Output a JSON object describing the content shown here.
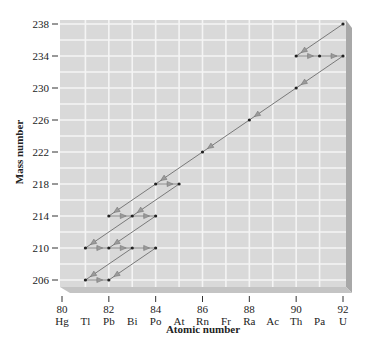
{
  "chart_data": {
    "type": "scatter",
    "title": "",
    "xlabel": "Atomic number",
    "ylabel": "Mass number",
    "xlim": [
      80,
      92
    ],
    "ylim": [
      206,
      238
    ],
    "grid": true,
    "x_ticks": [
      80,
      82,
      84,
      86,
      88,
      90,
      92
    ],
    "y_ticks": [
      206,
      210,
      214,
      218,
      222,
      226,
      230,
      234,
      238
    ],
    "element_labels": [
      {
        "z": 80,
        "symbol": "Hg"
      },
      {
        "z": 81,
        "symbol": "Tl"
      },
      {
        "z": 82,
        "symbol": "Pb"
      },
      {
        "z": 83,
        "symbol": "Bi"
      },
      {
        "z": 84,
        "symbol": "Po"
      },
      {
        "z": 85,
        "symbol": "At"
      },
      {
        "z": 86,
        "symbol": "Rn"
      },
      {
        "z": 87,
        "symbol": "Fr"
      },
      {
        "z": 88,
        "symbol": "Ra"
      },
      {
        "z": 89,
        "symbol": "Ac"
      },
      {
        "z": 90,
        "symbol": "Th"
      },
      {
        "z": 91,
        "symbol": "Pa"
      },
      {
        "z": 92,
        "symbol": "U"
      }
    ],
    "nuclides": [
      {
        "z": 92,
        "a": 238
      },
      {
        "z": 90,
        "a": 234
      },
      {
        "z": 91,
        "a": 234
      },
      {
        "z": 92,
        "a": 234
      },
      {
        "z": 90,
        "a": 230
      },
      {
        "z": 88,
        "a": 226
      },
      {
        "z": 86,
        "a": 222
      },
      {
        "z": 84,
        "a": 218
      },
      {
        "z": 85,
        "a": 218
      },
      {
        "z": 82,
        "a": 214
      },
      {
        "z": 83,
        "a": 214
      },
      {
        "z": 84,
        "a": 214
      },
      {
        "z": 81,
        "a": 210
      },
      {
        "z": 82,
        "a": 210
      },
      {
        "z": 83,
        "a": 210
      },
      {
        "z": 84,
        "a": 210
      },
      {
        "z": 81,
        "a": 206
      },
      {
        "z": 82,
        "a": 206
      }
    ],
    "decays": [
      {
        "from": [
          92,
          238
        ],
        "to": [
          90,
          234
        ],
        "mode": "alpha"
      },
      {
        "from": [
          90,
          234
        ],
        "to": [
          91,
          234
        ],
        "mode": "beta"
      },
      {
        "from": [
          91,
          234
        ],
        "to": [
          92,
          234
        ],
        "mode": "beta"
      },
      {
        "from": [
          92,
          234
        ],
        "to": [
          90,
          230
        ],
        "mode": "alpha"
      },
      {
        "from": [
          90,
          230
        ],
        "to": [
          88,
          226
        ],
        "mode": "alpha"
      },
      {
        "from": [
          88,
          226
        ],
        "to": [
          86,
          222
        ],
        "mode": "alpha"
      },
      {
        "from": [
          86,
          222
        ],
        "to": [
          84,
          218
        ],
        "mode": "alpha"
      },
      {
        "from": [
          84,
          218
        ],
        "to": [
          85,
          218
        ],
        "mode": "beta"
      },
      {
        "from": [
          84,
          218
        ],
        "to": [
          82,
          214
        ],
        "mode": "alpha"
      },
      {
        "from": [
          85,
          218
        ],
        "to": [
          83,
          214
        ],
        "mode": "alpha"
      },
      {
        "from": [
          82,
          214
        ],
        "to": [
          83,
          214
        ],
        "mode": "beta"
      },
      {
        "from": [
          83,
          214
        ],
        "to": [
          84,
          214
        ],
        "mode": "beta"
      },
      {
        "from": [
          83,
          214
        ],
        "to": [
          81,
          210
        ],
        "mode": "alpha"
      },
      {
        "from": [
          84,
          214
        ],
        "to": [
          82,
          210
        ],
        "mode": "alpha"
      },
      {
        "from": [
          81,
          210
        ],
        "to": [
          82,
          210
        ],
        "mode": "beta"
      },
      {
        "from": [
          82,
          210
        ],
        "to": [
          83,
          210
        ],
        "mode": "beta"
      },
      {
        "from": [
          83,
          210
        ],
        "to": [
          84,
          210
        ],
        "mode": "beta"
      },
      {
        "from": [
          83,
          210
        ],
        "to": [
          81,
          206
        ],
        "mode": "alpha"
      },
      {
        "from": [
          84,
          210
        ],
        "to": [
          82,
          206
        ],
        "mode": "alpha"
      },
      {
        "from": [
          81,
          206
        ],
        "to": [
          82,
          206
        ],
        "mode": "beta"
      }
    ],
    "colors": {
      "grid_fill": "#d9d9d9",
      "grid_lines": "#f4f4f4",
      "shadow": "#a8a8a8",
      "shadow_bottom": "#c4c4c4",
      "arrow": "#6e6e6e",
      "point": "#222222"
    }
  }
}
